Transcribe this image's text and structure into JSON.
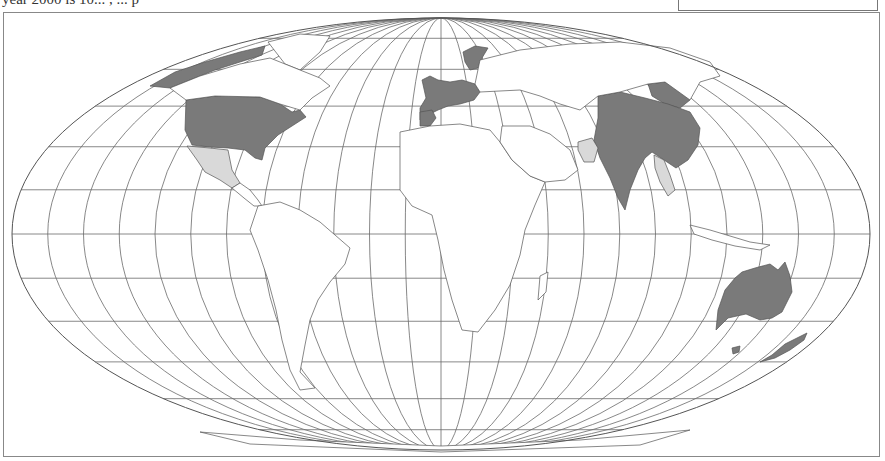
{
  "caption": {
    "text": "year 2000 is 10... , ... p"
  },
  "legend": {
    "visible": true
  },
  "map": {
    "projection": "mollweide-like pseudocylindrical",
    "ellipse": {
      "cx": 441,
      "cy": 234,
      "rx": 429,
      "ry": 216
    },
    "graticule": {
      "meridian_step_deg": 15,
      "parallel_step_deg": 15
    },
    "colors": {
      "outline": "#555555",
      "graticule": "#6a6a6a",
      "dark_fill": "#7a7a7a",
      "light_fill": "#d9d9d9",
      "land": "#ffffff"
    },
    "categories": [
      {
        "name": "dark",
        "color": "#7a7a7a",
        "regions": [
          "United States",
          "Alaska",
          "Canada (Arctic strip)",
          "Western Europe",
          "Scandinavia",
          "China",
          "India",
          "Bangladesh",
          "Australia",
          "New Zealand",
          "Russia (East Asia part)"
        ]
      },
      {
        "name": "light",
        "color": "#d9d9d9",
        "regions": [
          "Mexico",
          "Turkey",
          "Pakistan",
          "Southeast Asia (Myanmar/Thailand)"
        ]
      }
    ]
  }
}
